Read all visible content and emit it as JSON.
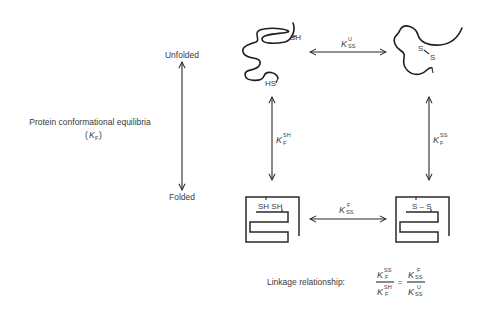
{
  "diagram": {
    "axis": {
      "top_label": "Unfolded",
      "bottom_label": "Folded",
      "side_label": "Protein conformational equilibria",
      "side_symbol_main": "K",
      "side_symbol_sub": "F"
    },
    "states": {
      "unfolded_reduced": {
        "thiol_top": "SH",
        "thiol_bottom": "HS"
      },
      "unfolded_oxidized": {
        "sulfur_1": "S",
        "sulfur_2": "S"
      },
      "folded_reduced": {
        "label": "SH SH"
      },
      "folded_oxidized": {
        "label": "S – S"
      }
    },
    "equilibria": {
      "k_ss_unfolded": {
        "main": "K",
        "sub": "SS",
        "sup": "U"
      },
      "k_ss_folded": {
        "main": "K",
        "sub": "SS",
        "sup": "F"
      },
      "k_f_sh": {
        "main": "K",
        "sub": "F",
        "sup": "SH"
      },
      "k_f_ss": {
        "main": "K",
        "sub": "F",
        "sup": "SS"
      }
    },
    "linkage": {
      "label": "Linkage relationship:",
      "equals": "=",
      "lhs_num": {
        "main": "K",
        "sub": "F",
        "sup": "SS"
      },
      "lhs_den": {
        "main": "K",
        "sub": "F",
        "sup": "SH"
      },
      "rhs_num": {
        "main": "K",
        "sub": "SS",
        "sup": "F"
      },
      "rhs_den": {
        "main": "K",
        "sub": "SS",
        "sup": "U"
      }
    }
  }
}
